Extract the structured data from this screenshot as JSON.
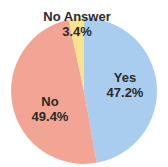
{
  "chart_data": {
    "type": "pie",
    "title": "",
    "categories": [
      "Yes",
      "No",
      "No Answer"
    ],
    "values": [
      47.2,
      49.4,
      3.4
    ],
    "unit": "%",
    "colors": [
      "#a9cdef",
      "#f2a594",
      "#fbe38c"
    ],
    "start_angle_deg": 0,
    "direction": "clockwise",
    "labels": [
      {
        "name": "Yes",
        "value": "47.2%"
      },
      {
        "name": "No",
        "value": "49.4%"
      },
      {
        "name": "No Answer",
        "value": "3.4%"
      }
    ],
    "legend": "none"
  }
}
